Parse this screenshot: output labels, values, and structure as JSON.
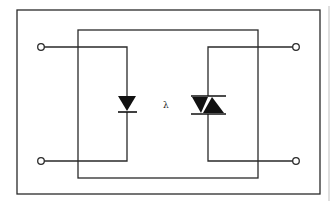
{
  "diagram": {
    "labels": {
      "light": "λ"
    },
    "components": [
      {
        "name": "input-terminal-top",
        "type": "terminal"
      },
      {
        "name": "input-terminal-bottom",
        "type": "terminal"
      },
      {
        "name": "led-diode",
        "type": "diode"
      },
      {
        "name": "triac",
        "type": "triac"
      },
      {
        "name": "output-terminal-top",
        "type": "terminal"
      },
      {
        "name": "output-terminal-bottom",
        "type": "terminal"
      }
    ],
    "colors": {
      "line": "#2a2a2a",
      "background": "#ffffff",
      "edge": "#bfbfbf"
    }
  }
}
